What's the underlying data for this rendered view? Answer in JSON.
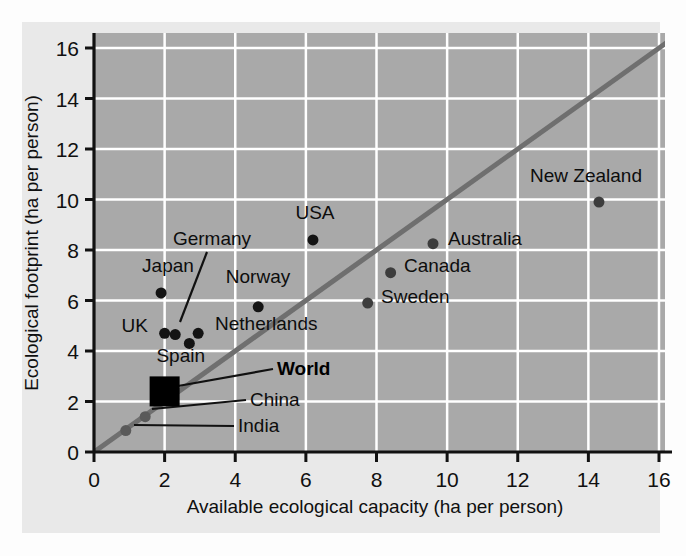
{
  "chart_data": {
    "type": "scatter",
    "title": "",
    "xlabel": "Available ecological capacity (ha per person)",
    "ylabel": "Ecological footprint (ha per person)",
    "xlim": [
      0,
      16.6
    ],
    "ylim": [
      0,
      16.8
    ],
    "xticks": [
      0,
      2,
      4,
      6,
      8,
      10,
      12,
      14,
      16
    ],
    "yticks": [
      0,
      2,
      4,
      6,
      8,
      10,
      12,
      14,
      16
    ],
    "xtick_labels": [
      "0",
      "2",
      "4",
      "6",
      "8",
      "10",
      "12",
      "14",
      "16"
    ],
    "ytick_labels": [
      "0",
      "2",
      "4",
      "6",
      "8",
      "10",
      "12",
      "14",
      "16"
    ],
    "grid": true,
    "grid_color": "#ffffff",
    "plot_bg": "#a9a9a9",
    "figure_bg": "#e9e9e9",
    "legend": "none",
    "reference_line": {
      "name": "y = x (break-even line)",
      "type": "line",
      "from": [
        0,
        0
      ],
      "to": [
        16.6,
        16.6
      ],
      "color": "#6f6f6f",
      "width": 5
    },
    "points": [
      {
        "label": "Japan",
        "x": 1.9,
        "y": 6.3,
        "marker": "circle",
        "color": "#141414",
        "size": 11,
        "label_pos": "above-left"
      },
      {
        "label": "UK",
        "x": 2.0,
        "y": 4.7,
        "marker": "circle",
        "color": "#141414",
        "size": 11,
        "label_pos": "left"
      },
      {
        "label": "Germany",
        "x": 2.3,
        "y": 4.65,
        "marker": "circle",
        "color": "#141414",
        "size": 11,
        "label_pos": "leader-above"
      },
      {
        "label": "Spain",
        "x": 2.7,
        "y": 4.3,
        "marker": "circle",
        "color": "#141414",
        "size": 11,
        "label_pos": "below-left"
      },
      {
        "label": "Netherlands",
        "x": 2.95,
        "y": 4.7,
        "marker": "circle",
        "color": "#141414",
        "size": 11,
        "label_pos": "right"
      },
      {
        "label": "Norway",
        "x": 4.65,
        "y": 5.75,
        "marker": "circle",
        "color": "#141414",
        "size": 11,
        "label_pos": "above"
      },
      {
        "label": "USA",
        "x": 6.2,
        "y": 8.4,
        "marker": "circle",
        "color": "#141414",
        "size": 11,
        "label_pos": "above"
      },
      {
        "label": "Sweden",
        "x": 7.75,
        "y": 5.9,
        "marker": "circle",
        "color": "#3d3d3d",
        "size": 11,
        "label_pos": "right"
      },
      {
        "label": "Canada",
        "x": 8.4,
        "y": 7.1,
        "marker": "circle",
        "color": "#3d3d3d",
        "size": 11,
        "label_pos": "right"
      },
      {
        "label": "Australia",
        "x": 9.6,
        "y": 8.25,
        "marker": "circle",
        "color": "#3d3d3d",
        "size": 11,
        "label_pos": "right"
      },
      {
        "label": "New Zealand",
        "x": 14.3,
        "y": 9.9,
        "marker": "circle",
        "color": "#3d3d3d",
        "size": 11,
        "label_pos": "above"
      },
      {
        "label": "World",
        "x": 2.0,
        "y": 2.4,
        "marker": "square",
        "color": "#000000",
        "size": 30,
        "label_pos": "leader-right",
        "bold": true
      },
      {
        "label": "China",
        "x": 1.45,
        "y": 1.4,
        "marker": "circle",
        "color": "#5a5a5a",
        "size": 11,
        "label_pos": "leader-right"
      },
      {
        "label": "India",
        "x": 0.9,
        "y": 0.85,
        "marker": "circle",
        "color": "#5a5a5a",
        "size": 11,
        "label_pos": "leader-right"
      }
    ]
  },
  "axes": {
    "x_title": "Available ecological capacity (ha per person)",
    "y_title": "Ecological footprint (ha per person)",
    "x_ticks": [
      "0",
      "2",
      "4",
      "6",
      "8",
      "10",
      "12",
      "14",
      "16"
    ],
    "y_ticks": [
      "0",
      "2",
      "4",
      "6",
      "8",
      "10",
      "12",
      "14",
      "16"
    ]
  },
  "labels": {
    "japan": "Japan",
    "uk": "UK",
    "germany": "Germany",
    "spain": "Spain",
    "netherlands": "Netherlands",
    "norway": "Norway",
    "usa": "USA",
    "sweden": "Sweden",
    "canada": "Canada",
    "australia": "Australia",
    "new_zealand": "New Zealand",
    "world": "World",
    "china": "China",
    "india": "India"
  },
  "colors": {
    "plot_background": "#a9a9a9",
    "figure_background": "#e9e9e9",
    "grid": "#ffffff",
    "axis": "#111111",
    "reference_line": "#6f6f6f",
    "marker_dark": "#141414",
    "marker_mid": "#3d3d3d",
    "marker_light": "#5a5a5a"
  }
}
